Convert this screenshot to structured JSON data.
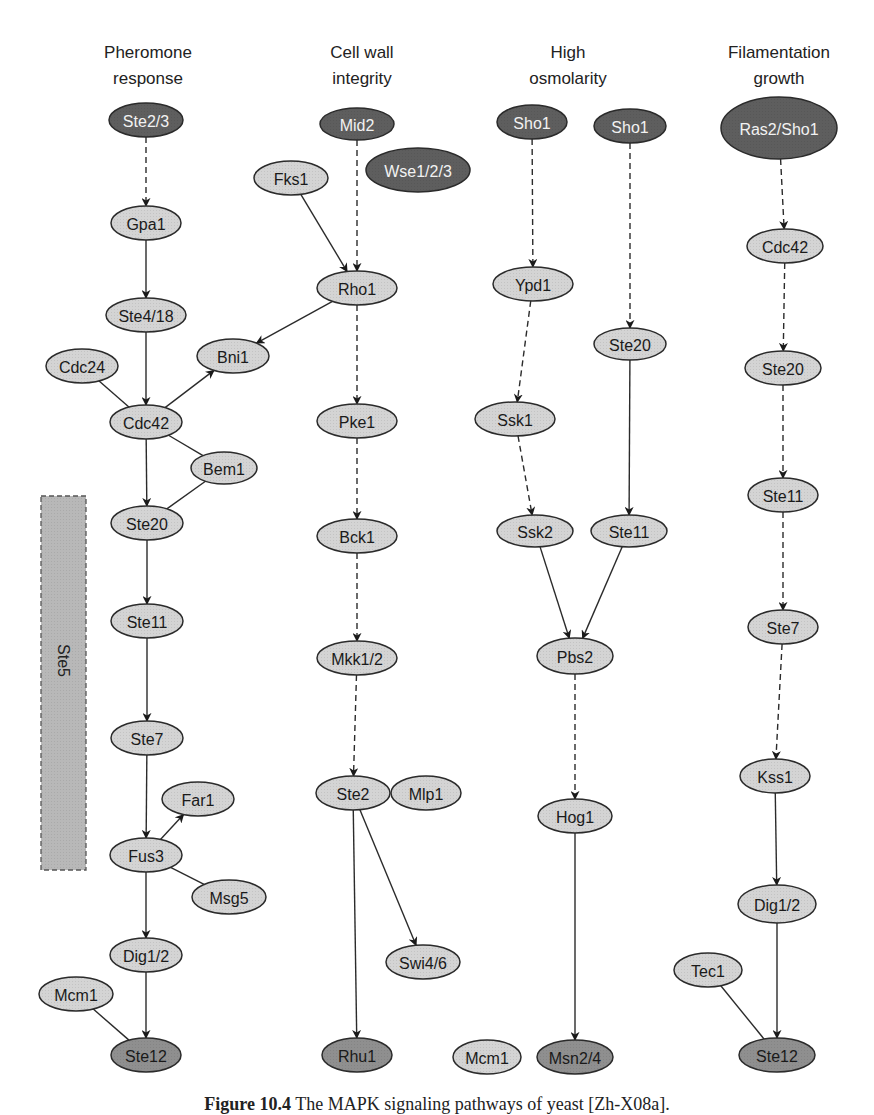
{
  "colors": {
    "light_fill": "#d4d4d4",
    "medium_fill": "#8f8f8f",
    "dark_fill": "#5e5e5e",
    "stroke": "#2b2b2b",
    "light_text": "#1a1a1a",
    "dark_text": "#f2f2f2",
    "ste5_box_fill": "#b8b8b8"
  },
  "columns": [
    {
      "id": "pheromone",
      "title": [
        "Pheromone",
        "response"
      ],
      "x": 148
    },
    {
      "id": "cwi",
      "title": [
        "Cell wall",
        "integrity"
      ],
      "x": 362
    },
    {
      "id": "hog",
      "title": [
        "High",
        "osmolarity"
      ],
      "x": 568
    },
    {
      "id": "fg",
      "title": [
        "Filamentation",
        "growth"
      ],
      "x": 779
    }
  ],
  "scaffold": {
    "label": "Ste5",
    "x": 41,
    "y": 496,
    "w": 45,
    "h": 374
  },
  "nodes": [
    {
      "id": "p_ste23",
      "label": "Ste2/3",
      "cx": 146,
      "cy": 120,
      "rx": 37,
      "ry": 17,
      "shade": "dark"
    },
    {
      "id": "p_gpa1",
      "label": "Gpa1",
      "cx": 146,
      "cy": 223,
      "rx": 35,
      "ry": 17,
      "shade": "light"
    },
    {
      "id": "p_ste418",
      "label": "Ste4/18",
      "cx": 146,
      "cy": 315,
      "rx": 40,
      "ry": 17,
      "shade": "light"
    },
    {
      "id": "p_cdc24",
      "label": "Cdc24",
      "cx": 82,
      "cy": 366,
      "rx": 36,
      "ry": 17,
      "shade": "light"
    },
    {
      "id": "p_bni1",
      "label": "Bni1",
      "cx": 233,
      "cy": 356,
      "rx": 36,
      "ry": 17,
      "shade": "light"
    },
    {
      "id": "p_cdc42",
      "label": "Cdc42",
      "cx": 146,
      "cy": 422,
      "rx": 36,
      "ry": 17,
      "shade": "light"
    },
    {
      "id": "p_bem1",
      "label": "Bem1",
      "cx": 224,
      "cy": 468,
      "rx": 33,
      "ry": 16,
      "shade": "light"
    },
    {
      "id": "p_ste20",
      "label": "Ste20",
      "cx": 147,
      "cy": 523,
      "rx": 36,
      "ry": 17,
      "shade": "light"
    },
    {
      "id": "p_ste11",
      "label": "Ste11",
      "cx": 147,
      "cy": 621,
      "rx": 36,
      "ry": 17,
      "shade": "light"
    },
    {
      "id": "p_ste7",
      "label": "Ste7",
      "cx": 147,
      "cy": 738,
      "rx": 36,
      "ry": 17,
      "shade": "light"
    },
    {
      "id": "p_far1",
      "label": "Far1",
      "cx": 198,
      "cy": 799,
      "rx": 36,
      "ry": 17,
      "shade": "light"
    },
    {
      "id": "p_fus3",
      "label": "Fus3",
      "cx": 146,
      "cy": 855,
      "rx": 36,
      "ry": 17,
      "shade": "light"
    },
    {
      "id": "p_msg5",
      "label": "Msg5",
      "cx": 229,
      "cy": 897,
      "rx": 37,
      "ry": 17,
      "shade": "light"
    },
    {
      "id": "p_dig12",
      "label": "Dig1/2",
      "cx": 146,
      "cy": 955,
      "rx": 36,
      "ry": 17,
      "shade": "light"
    },
    {
      "id": "p_mcm1",
      "label": "Mcm1",
      "cx": 76,
      "cy": 994,
      "rx": 37,
      "ry": 17,
      "shade": "light"
    },
    {
      "id": "p_ste12",
      "label": "Ste12",
      "cx": 146,
      "cy": 1055,
      "rx": 35,
      "ry": 17,
      "shade": "medium"
    },
    {
      "id": "c_mid2",
      "label": "Mid2",
      "cx": 357,
      "cy": 124,
      "rx": 37,
      "ry": 16,
      "shade": "dark"
    },
    {
      "id": "c_wse123",
      "label": "Wse1/2/3",
      "cx": 418,
      "cy": 170,
      "rx": 52,
      "ry": 22,
      "shade": "dark"
    },
    {
      "id": "c_fks1",
      "label": "Fks1",
      "cx": 291,
      "cy": 178,
      "rx": 37,
      "ry": 17,
      "shade": "light"
    },
    {
      "id": "c_rho1",
      "label": "Rho1",
      "cx": 357,
      "cy": 288,
      "rx": 40,
      "ry": 17,
      "shade": "light"
    },
    {
      "id": "c_pke1",
      "label": "Pke1",
      "cx": 357,
      "cy": 421,
      "rx": 40,
      "ry": 17,
      "shade": "light"
    },
    {
      "id": "c_bck1",
      "label": "Bck1",
      "cx": 357,
      "cy": 536,
      "rx": 40,
      "ry": 17,
      "shade": "light"
    },
    {
      "id": "c_mkk12",
      "label": "Mkk1/2",
      "cx": 357,
      "cy": 658,
      "rx": 40,
      "ry": 17,
      "shade": "light"
    },
    {
      "id": "c_ste2",
      "label": "Ste2",
      "cx": 353,
      "cy": 793,
      "rx": 37,
      "ry": 17,
      "shade": "light"
    },
    {
      "id": "c_mlp1",
      "label": "Mlp1",
      "cx": 426,
      "cy": 793,
      "rx": 35,
      "ry": 17,
      "shade": "light"
    },
    {
      "id": "c_swi46",
      "label": "Swi4/6",
      "cx": 423,
      "cy": 962,
      "rx": 37,
      "ry": 17,
      "shade": "light"
    },
    {
      "id": "c_rhu1",
      "label": "Rhu1",
      "cx": 357,
      "cy": 1055,
      "rx": 35,
      "ry": 17,
      "shade": "medium"
    },
    {
      "id": "h_sho1a",
      "label": "Sho1",
      "cx": 532,
      "cy": 122,
      "rx": 35,
      "ry": 17,
      "shade": "dark"
    },
    {
      "id": "h_sho1b",
      "label": "Sho1",
      "cx": 630,
      "cy": 126,
      "rx": 36,
      "ry": 17,
      "shade": "dark"
    },
    {
      "id": "h_ypd1",
      "label": "Ypd1",
      "cx": 533,
      "cy": 284,
      "rx": 40,
      "ry": 17,
      "shade": "light"
    },
    {
      "id": "h_ste20",
      "label": "Ste20",
      "cx": 630,
      "cy": 344,
      "rx": 36,
      "ry": 16,
      "shade": "light"
    },
    {
      "id": "h_ssk1",
      "label": "Ssk1",
      "cx": 515,
      "cy": 419,
      "rx": 40,
      "ry": 17,
      "shade": "light"
    },
    {
      "id": "h_ssk2",
      "label": "Ssk2",
      "cx": 535,
      "cy": 531,
      "rx": 38,
      "ry": 16,
      "shade": "light"
    },
    {
      "id": "h_ste11",
      "label": "Ste11",
      "cx": 629,
      "cy": 531,
      "rx": 38,
      "ry": 16,
      "shade": "light"
    },
    {
      "id": "h_pbs2",
      "label": "Pbs2",
      "cx": 575,
      "cy": 656,
      "rx": 38,
      "ry": 18,
      "shade": "light"
    },
    {
      "id": "h_hog1",
      "label": "Hog1",
      "cx": 575,
      "cy": 816,
      "rx": 37,
      "ry": 17,
      "shade": "light"
    },
    {
      "id": "h_mcm1",
      "label": "Mcm1",
      "cx": 487,
      "cy": 1057,
      "rx": 34,
      "ry": 17,
      "shade": "light"
    },
    {
      "id": "h_msn24",
      "label": "Msn2/4",
      "cx": 575,
      "cy": 1057,
      "rx": 38,
      "ry": 17,
      "shade": "medium"
    },
    {
      "id": "f_ras2sho1",
      "label": "Ras2/Sho1",
      "cx": 779,
      "cy": 128,
      "rx": 58,
      "ry": 31,
      "shade": "dark"
    },
    {
      "id": "f_cdc42",
      "label": "Cdc42",
      "cx": 785,
      "cy": 246,
      "rx": 38,
      "ry": 17,
      "shade": "light"
    },
    {
      "id": "f_ste20",
      "label": "Ste20",
      "cx": 783,
      "cy": 368,
      "rx": 38,
      "ry": 17,
      "shade": "light"
    },
    {
      "id": "f_ste11",
      "label": "Ste11",
      "cx": 783,
      "cy": 495,
      "rx": 35,
      "ry": 17,
      "shade": "light"
    },
    {
      "id": "f_ste7",
      "label": "Ste7",
      "cx": 783,
      "cy": 627,
      "rx": 35,
      "ry": 17,
      "shade": "light"
    },
    {
      "id": "f_kss1",
      "label": "Kss1",
      "cx": 775,
      "cy": 776,
      "rx": 35,
      "ry": 17,
      "shade": "light"
    },
    {
      "id": "f_dig12",
      "label": "Dig1/2",
      "cx": 777,
      "cy": 904,
      "rx": 39,
      "ry": 19,
      "shade": "light"
    },
    {
      "id": "f_tec1",
      "label": "Tec1",
      "cx": 708,
      "cy": 970,
      "rx": 34,
      "ry": 17,
      "shade": "light"
    },
    {
      "id": "f_ste12",
      "label": "Ste12",
      "cx": 777,
      "cy": 1055,
      "rx": 38,
      "ry": 17,
      "shade": "medium"
    }
  ],
  "edges": [
    {
      "from": "p_ste23",
      "to": "p_gpa1",
      "style": "dashed",
      "arrow": true
    },
    {
      "from": "p_gpa1",
      "to": "p_ste418",
      "style": "solid",
      "arrow": true
    },
    {
      "from": "p_ste418",
      "to": "p_cdc42",
      "style": "solid",
      "arrow": true
    },
    {
      "from": "p_cdc24",
      "to": "p_cdc42",
      "style": "solid",
      "arrow": false
    },
    {
      "from": "p_cdc42",
      "to": "p_bni1",
      "style": "solid",
      "arrow": true
    },
    {
      "from": "p_cdc42",
      "to": "p_bem1",
      "style": "solid",
      "arrow": false
    },
    {
      "from": "p_cdc42",
      "to": "p_ste20",
      "style": "solid",
      "arrow": true
    },
    {
      "from": "p_bem1",
      "to": "p_ste20",
      "style": "solid",
      "arrow": false
    },
    {
      "from": "p_ste20",
      "to": "p_ste11",
      "style": "solid",
      "arrow": true
    },
    {
      "from": "p_ste11",
      "to": "p_ste7",
      "style": "solid",
      "arrow": true
    },
    {
      "from": "p_ste7",
      "to": "p_fus3",
      "style": "solid",
      "arrow": true
    },
    {
      "from": "p_fus3",
      "to": "p_far1",
      "style": "solid",
      "arrow": true
    },
    {
      "from": "p_fus3",
      "to": "p_msg5",
      "style": "solid",
      "arrow": false
    },
    {
      "from": "p_fus3",
      "to": "p_dig12",
      "style": "solid",
      "arrow": true
    },
    {
      "from": "p_dig12",
      "to": "p_ste12",
      "style": "solid",
      "arrow": true
    },
    {
      "from": "p_mcm1",
      "to": "p_ste12",
      "style": "solid",
      "arrow": false
    },
    {
      "from": "c_mid2",
      "to": "c_rho1",
      "style": "dashed",
      "arrow": true
    },
    {
      "from": "c_fks1",
      "to": "c_rho1",
      "style": "solid",
      "arrow": true
    },
    {
      "from": "c_rho1",
      "to": "p_bni1",
      "style": "solid",
      "arrow": true
    },
    {
      "from": "c_rho1",
      "to": "c_pke1",
      "style": "dashed",
      "arrow": true
    },
    {
      "from": "c_pke1",
      "to": "c_bck1",
      "style": "dashed",
      "arrow": true
    },
    {
      "from": "c_bck1",
      "to": "c_mkk12",
      "style": "dashed",
      "arrow": true
    },
    {
      "from": "c_mkk12",
      "to": "c_ste2",
      "style": "dashed",
      "arrow": true
    },
    {
      "from": "c_ste2",
      "to": "c_swi46",
      "style": "solid",
      "arrow": true
    },
    {
      "from": "c_ste2",
      "to": "c_rhu1",
      "style": "solid",
      "arrow": true
    },
    {
      "from": "h_sho1a",
      "to": "h_ypd1",
      "style": "dashed",
      "arrow": true
    },
    {
      "from": "h_sho1b",
      "to": "h_ste20",
      "style": "dashed",
      "arrow": true
    },
    {
      "from": "h_ypd1",
      "to": "h_ssk1",
      "style": "dashed",
      "arrow": true
    },
    {
      "from": "h_ssk1",
      "to": "h_ssk2",
      "style": "dashed",
      "arrow": true
    },
    {
      "from": "h_ste20",
      "to": "h_ste11",
      "style": "solid",
      "arrow": true
    },
    {
      "from": "h_ssk2",
      "to": "h_pbs2",
      "style": "solid",
      "arrow": true
    },
    {
      "from": "h_ste11",
      "to": "h_pbs2",
      "style": "solid",
      "arrow": true
    },
    {
      "from": "h_pbs2",
      "to": "h_hog1",
      "style": "dashed",
      "arrow": true
    },
    {
      "from": "h_hog1",
      "to": "h_msn24",
      "style": "solid",
      "arrow": true
    },
    {
      "from": "f_ras2sho1",
      "to": "f_cdc42",
      "style": "dashed",
      "arrow": true
    },
    {
      "from": "f_cdc42",
      "to": "f_ste20",
      "style": "dashed",
      "arrow": true
    },
    {
      "from": "f_ste20",
      "to": "f_ste11",
      "style": "dashed",
      "arrow": true
    },
    {
      "from": "f_ste11",
      "to": "f_ste7",
      "style": "dashed",
      "arrow": true
    },
    {
      "from": "f_ste7",
      "to": "f_kss1",
      "style": "dashed",
      "arrow": true
    },
    {
      "from": "f_kss1",
      "to": "f_dig12",
      "style": "solid",
      "arrow": true
    },
    {
      "from": "f_dig12",
      "to": "f_ste12",
      "style": "solid",
      "arrow": true
    },
    {
      "from": "f_tec1",
      "to": "f_ste12",
      "style": "solid",
      "arrow": false
    }
  ],
  "caption": {
    "label": "Figure 10.4",
    "text": "The MAPK signaling pathways of yeast [Zh-X08a]."
  }
}
